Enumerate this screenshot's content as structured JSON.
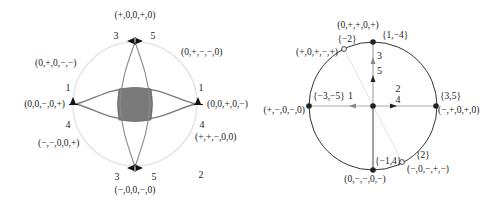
{
  "colors": {
    "background": "#ffffff",
    "left_circle": "#e4e4e4",
    "left_curves": "#8a8a8a",
    "left_shaded_region": "#7a7a7a",
    "right_circle": "#333333",
    "right_axes": "#aaaaaa",
    "right_axis_lower": "#444444",
    "right_diagonal": "#e2e2e2",
    "marker": "#111111"
  },
  "left_diagram": {
    "top": {
      "sign_vector": "(+,0,0,+,0)",
      "label_left": "3",
      "label_right": "5"
    },
    "bottom": {
      "sign_vector": "(−,0,0,−,0)",
      "label_left": "3",
      "label_right": "5"
    },
    "left": {
      "sign_vector": "(0,0,−,0,+)",
      "label_above": "1",
      "label_below": "4"
    },
    "right": {
      "sign_vector": "(0,0,+,0,−)",
      "label_above": "1",
      "label_below": "4"
    },
    "upper_left_region": "(0,+,0,−,−)",
    "upper_right_region": "(0,+,−,−,0)",
    "lower_left_region": "(−,−,0,0,+)",
    "lower_right_region": "(+,+,−,0,0)",
    "lower_right_number": "2"
  },
  "right_diagram": {
    "top_point": {
      "set": "{1,−4}"
    },
    "upper_left_hollow": {
      "set": "{−2}",
      "sign_vector_above": "(0,+,+,0,+)",
      "sign_vector_left": "(+,0,+,−,+)"
    },
    "left_point": {
      "set": "{−3,−5}",
      "sign_vector": "(+,−,0,−,0)",
      "edge_label": "1"
    },
    "right_point": {
      "set": "{3,5}",
      "sign_vector": "(−,+,0,+,0)"
    },
    "bottom_point": {
      "set": "{−1,4}",
      "sign_vector": "(0,−,−,0,−)"
    },
    "lower_right_hollow": {
      "set": "{2}",
      "sign_vector": "(−,0,−,+,−)"
    },
    "vertical_edge_labels": [
      "3",
      "5"
    ],
    "horizontal_edge_labels": [
      "2",
      "4"
    ]
  }
}
